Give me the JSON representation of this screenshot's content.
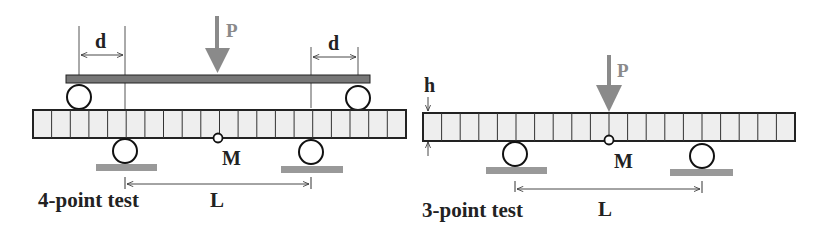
{
  "diagrams": {
    "four_point": {
      "title": "4-point test",
      "load_label": "P",
      "offset_label_left": "d",
      "offset_label_right": "d",
      "span_label": "L",
      "midpoint_label": "M"
    },
    "three_point": {
      "title": "3-point test",
      "load_label": "P",
      "height_label": "h",
      "span_label": "L",
      "midpoint_label": "M"
    }
  },
  "colors": {
    "beam_fill": "#eeeeee",
    "outline": "#222222",
    "load_arrow": "#8a8a8a",
    "plate": "#777777",
    "ground": "#999999"
  }
}
